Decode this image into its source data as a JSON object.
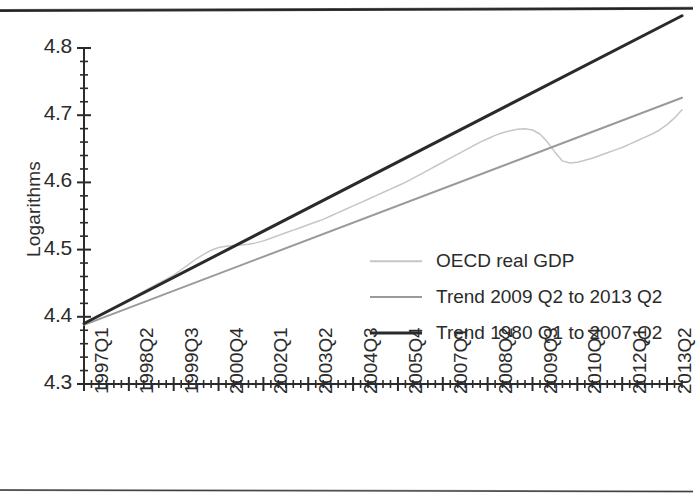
{
  "figure": {
    "name": "oecd-real-gdp-vs-trend-chart",
    "ylabel": "Logarithms"
  },
  "chart_data": {
    "type": "line",
    "title": "",
    "xlabel": "",
    "ylabel": "Logarithms",
    "ylim": [
      4.3,
      4.8
    ],
    "ytick_values": [
      4.3,
      4.4,
      4.5,
      4.6,
      4.7,
      4.8
    ],
    "ytick_labels": [
      "4.3",
      "4.4",
      "4.5",
      "4.6",
      "4.7",
      "4.8"
    ],
    "y_minor_tick_step": 0.02,
    "grid": false,
    "legend_position": "center-right",
    "x_major_tick_labels": [
      "1997Q1",
      "1998Q2",
      "1999Q3",
      "2000Q4",
      "2002Q1",
      "2003Q2",
      "2004Q3",
      "2005Q4",
      "2007Q1",
      "2008Q2",
      "2009Q3",
      "2010Q4",
      "2012Q1",
      "2013Q2"
    ],
    "x_major_tick_quarter_index": [
      0,
      6,
      12,
      18,
      24,
      30,
      36,
      42,
      48,
      54,
      60,
      66,
      72,
      78
    ],
    "x_minor_tick_step_quarters": 1,
    "x_range_quarters": [
      0,
      80
    ],
    "series": [
      {
        "name": "OECD real GDP",
        "color": "#c6c6c6",
        "width": 1.5,
        "x": [
          0,
          1,
          2,
          3,
          4,
          5,
          6,
          7,
          8,
          9,
          10,
          11,
          12,
          13,
          14,
          15,
          16,
          17,
          18,
          19,
          20,
          21,
          22,
          23,
          24,
          25,
          26,
          27,
          28,
          29,
          30,
          31,
          32,
          33,
          34,
          35,
          36,
          37,
          38,
          39,
          40,
          41,
          42,
          43,
          44,
          45,
          46,
          47,
          48,
          49,
          50,
          51,
          52,
          53,
          54,
          55,
          56,
          57,
          58,
          59,
          60,
          61,
          62,
          63,
          64,
          65,
          66,
          67,
          68,
          69,
          70,
          71,
          72,
          73,
          74,
          75,
          76,
          77,
          78,
          79,
          80
        ],
        "values": [
          4.39,
          4.396,
          4.402,
          4.408,
          4.414,
          4.42,
          4.426,
          4.432,
          4.438,
          4.444,
          4.45,
          4.456,
          4.462,
          4.47,
          4.478,
          4.486,
          4.493,
          4.499,
          4.503,
          4.505,
          4.506,
          4.507,
          4.508,
          4.51,
          4.513,
          4.517,
          4.521,
          4.525,
          4.529,
          4.533,
          4.537,
          4.541,
          4.545,
          4.55,
          4.555,
          4.56,
          4.565,
          4.57,
          4.575,
          4.58,
          4.585,
          4.59,
          4.595,
          4.6,
          4.606,
          4.612,
          4.618,
          4.624,
          4.63,
          4.636,
          4.642,
          4.648,
          4.654,
          4.66,
          4.665,
          4.67,
          4.674,
          4.677,
          4.679,
          4.68,
          4.678,
          4.672,
          4.66,
          4.645,
          4.632,
          4.629,
          4.63,
          4.633,
          4.636,
          4.64,
          4.644,
          4.648,
          4.652,
          4.657,
          4.662,
          4.667,
          4.672,
          4.678,
          4.686,
          4.696,
          4.708
        ]
      },
      {
        "name": "Trend 2009 Q2 to 2013 Q2",
        "color": "#9a9a9a",
        "width": 2,
        "x": [
          0,
          80
        ],
        "values": [
          4.388,
          4.726
        ]
      },
      {
        "name": "Trend 1980 Q1 to 2007 Q2",
        "color": "#2a2a2a",
        "width": 3,
        "x": [
          0,
          80
        ],
        "values": [
          4.39,
          4.848
        ]
      }
    ]
  },
  "legend": {
    "entries": [
      {
        "label": "OECD real GDP",
        "swatch": "line-swatch-light-gray"
      },
      {
        "label": "Trend 2009 Q2 to 2013 Q2",
        "swatch": "line-swatch-medium-gray"
      },
      {
        "label": "Trend 1980 Q1 to 2007 Q2",
        "swatch": "line-swatch-black"
      }
    ]
  },
  "colors": {
    "gdp_line": "#c6c6c6",
    "trend_new_line": "#9a9a9a",
    "trend_old_line": "#2a2a2a",
    "axis": "#2b2b2b",
    "background": "#ffffff"
  }
}
